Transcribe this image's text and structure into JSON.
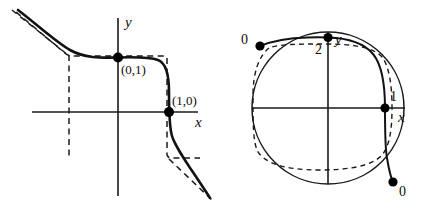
{
  "figure": {
    "title": "",
    "panels": [
      {
        "id": "cartesian-plane",
        "axes": {
          "x_label": "x",
          "y_label": "y"
        },
        "points": [
          {
            "name": "point-0-1",
            "label": "(0,1)"
          },
          {
            "name": "point-1-0",
            "label": "(1,0)"
          }
        ],
        "curves": [
          {
            "name": "solid-curve",
            "style": "solid",
            "description": "decreasing curve through (0,1) and (1,0)"
          },
          {
            "name": "dashed-asymptote-box",
            "style": "dashed",
            "description": "dashed rectangular asymptote envelope"
          }
        ]
      },
      {
        "id": "projective-disk",
        "axes": {
          "x_label": "x",
          "y_label": "y"
        },
        "points": [
          {
            "name": "point-upper-left-zero",
            "label": "0"
          },
          {
            "name": "point-top-two",
            "label": "2"
          },
          {
            "name": "point-right-one",
            "label": "1"
          },
          {
            "name": "point-lower-right-zero",
            "label": "0"
          }
        ],
        "curves": [
          {
            "name": "boundary-circle",
            "style": "solid",
            "description": "disk boundary circle"
          },
          {
            "name": "solid-arc-curve",
            "style": "solid",
            "description": "bold arc from 0 through 2 and 1 to 0"
          },
          {
            "name": "dashed-closed-curve",
            "style": "dashed",
            "description": "dashed rounded-square closed curve"
          }
        ]
      }
    ]
  },
  "labels": {
    "x": "x",
    "y": "y",
    "p01": "(0,1)",
    "p10": "(1,0)",
    "zero": "0",
    "one": "1",
    "two": "2"
  }
}
